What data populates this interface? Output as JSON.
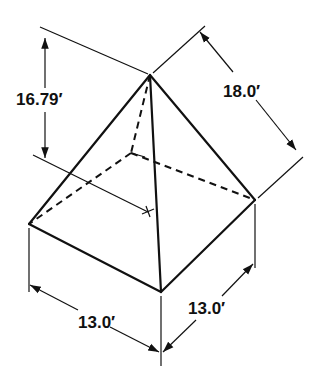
{
  "diagram": {
    "dimensions": {
      "height": "16.79′",
      "slant_edge": "18.0′",
      "base_left": "13.0′",
      "base_right": "13.0′"
    },
    "colors": {
      "line": "#111111",
      "background": "#ffffff"
    }
  }
}
